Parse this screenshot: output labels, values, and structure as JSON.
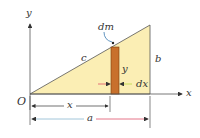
{
  "figure": {
    "labels": {
      "y_axis": "y",
      "x_axis": "x",
      "origin": "O",
      "hypotenuse": "c",
      "height": "b",
      "element": "dm",
      "strip_height": "y",
      "strip_width": "dx",
      "x_dim": "x",
      "a_dim": "a"
    },
    "colors": {
      "triangle_fill": "#fbeeb4",
      "strip_fill": "#c8702c",
      "axis": "#555555",
      "arrow_red": "#e0506a",
      "arrow_green": "#bcd84a",
      "arrow_blue": "#8ab8d0"
    }
  }
}
